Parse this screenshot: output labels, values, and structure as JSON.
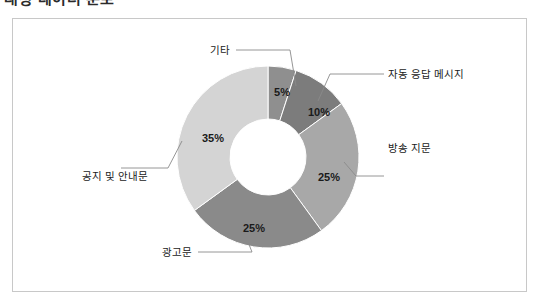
{
  "page": {
    "heading": "대상 데이터 분포"
  },
  "chart_data": {
    "type": "pie",
    "variant": "donut",
    "title": "",
    "subtitle": "",
    "xlabel": "",
    "ylabel": "",
    "legend_position": "none",
    "grid": false,
    "start_angle_deg": 0,
    "direction": "clockwise",
    "hole_ratio": 0.42,
    "categories": [
      "기타",
      "자동 응답 메시지",
      "방송 지문",
      "광고문",
      "공지 및 안내문"
    ],
    "values": [
      5,
      10,
      25,
      25,
      35
    ],
    "value_labels": [
      "5%",
      "10%",
      "25%",
      "25%",
      "35%"
    ],
    "unit": "%",
    "total": 100,
    "slices": [
      {
        "label": "기타",
        "value": 5,
        "value_label": "5%",
        "color": "#8f8f8f",
        "pct_label_pos": {
          "x": 282,
          "y": 96
        },
        "cat_label_pos": {
          "x": 230,
          "y": 54
        },
        "cat_anchor": "end",
        "leader": "M 236 50 L 290 50 L 296 86"
      },
      {
        "label": "자동 응답 메시지",
        "value": 10,
        "value_label": "10%",
        "color": "#7c7c7c",
        "pct_label_pos": {
          "x": 319,
          "y": 116
        },
        "cat_label_pos": {
          "x": 388,
          "y": 78
        },
        "cat_anchor": "start",
        "leader": "M 384 74 L 330 74 L 318 101"
      },
      {
        "label": "방송 지문",
        "value": 25,
        "value_label": "25%",
        "color": "#a8a8a8",
        "pct_label_pos": {
          "x": 329,
          "y": 181
        },
        "cat_label_pos": {
          "x": 388,
          "y": 152
        },
        "cat_anchor": "start",
        "leader": "M 384 176 L 356 176 L 344 162"
      },
      {
        "label": "광고문",
        "value": 25,
        "value_label": "25%",
        "color": "#8a8a8a",
        "pct_label_pos": {
          "x": 254,
          "y": 232
        },
        "cat_label_pos": {
          "x": 192,
          "y": 256
        },
        "cat_anchor": "end",
        "leader": "M 198 252 L 252 252 L 246 237"
      },
      {
        "label": "공지 및 안내문",
        "value": 35,
        "value_label": "35%",
        "color": "#d4d4d4",
        "pct_label_pos": {
          "x": 213,
          "y": 142
        },
        "cat_label_pos": {
          "x": 148,
          "y": 180
        },
        "cat_anchor": "end",
        "leader": "M 121 168 L 168 168 L 182 141"
      }
    ]
  },
  "geometry": {
    "center_x": 268,
    "center_y": 157,
    "outer_radius": 91,
    "inner_radius": 38
  },
  "colors": {
    "frame_border": "#c8c8c8",
    "background": "#ffffff",
    "leader": "#8a8a8a",
    "text": "#1a1a1a"
  }
}
